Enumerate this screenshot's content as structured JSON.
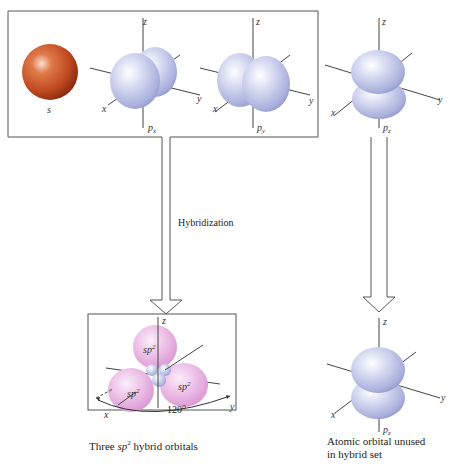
{
  "diagram": {
    "title_concept": "sp2 hybridization",
    "top_orbitals": [
      {
        "id": "s",
        "label": "s",
        "color": "#c8552c"
      },
      {
        "id": "px",
        "label": "p",
        "sub": "x",
        "color": "#b7bee6"
      },
      {
        "id": "py",
        "label": "p",
        "sub": "y",
        "color": "#b7bee6"
      },
      {
        "id": "pz",
        "label": "p",
        "sub": "z",
        "color": "#b7bee6"
      }
    ],
    "axis_labels": {
      "x": "x",
      "y": "y",
      "z": "z"
    },
    "process_label": "Hybridization",
    "hybrid": {
      "lobe_label": "sp",
      "lobe_sup": "2",
      "lobe_count": 3,
      "angle_label": "120°",
      "color": "#e8b6e0"
    },
    "captions": {
      "hybrid_pre": "Three ",
      "hybrid_term": "sp",
      "hybrid_sup": "2",
      "hybrid_post": " hybrid orbitals",
      "unused_line1": "Atomic orbital unused",
      "unused_line2": "in hybrid set"
    },
    "bottom_right_orbital": {
      "label": "p",
      "sub": "z"
    }
  }
}
